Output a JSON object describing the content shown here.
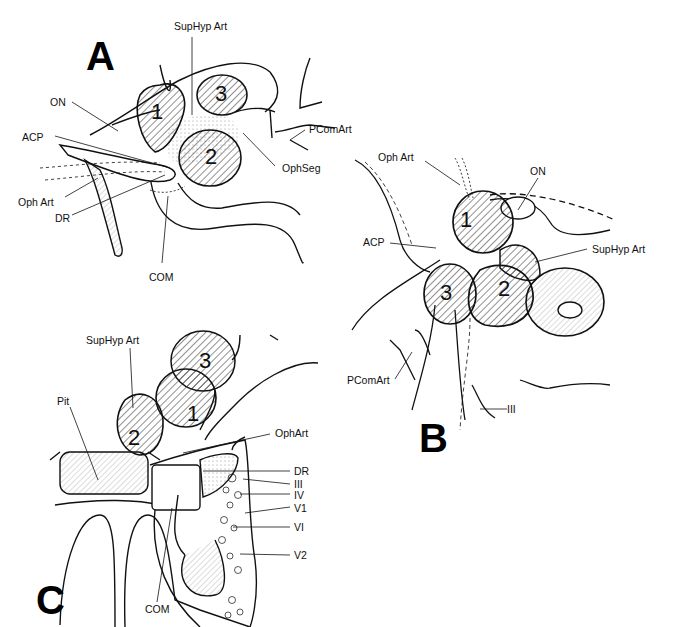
{
  "figure": {
    "panels": [
      {
        "id": "A",
        "letter": "A",
        "aneurysm_numbers": [
          "1",
          "2",
          "3"
        ],
        "labels": {
          "suphypart": "SupHyp Art",
          "on": "ON",
          "acp": "ACP",
          "pcomart": "PComArt",
          "ophseg": "OphSeg",
          "ophart": "Oph Art",
          "dr": "DR",
          "com": "COM"
        }
      },
      {
        "id": "B",
        "letter": "B",
        "aneurysm_numbers": [
          "1",
          "2",
          "3"
        ],
        "labels": {
          "ophart": "Oph Art",
          "on": "ON",
          "acp": "ACP",
          "suphypart": "SupHyp Art",
          "pcomart": "PComArt",
          "iii": "III"
        }
      },
      {
        "id": "C",
        "letter": "C",
        "aneurysm_numbers": [
          "1",
          "2",
          "3"
        ],
        "labels": {
          "suphypart": "SupHyp Art",
          "pit": "Pit",
          "ophart": "OphArt",
          "dr": "DR",
          "iii": "III",
          "iv": "IV",
          "v1": "V1",
          "vi": "VI",
          "v2": "V2",
          "com": "COM"
        }
      }
    ]
  }
}
